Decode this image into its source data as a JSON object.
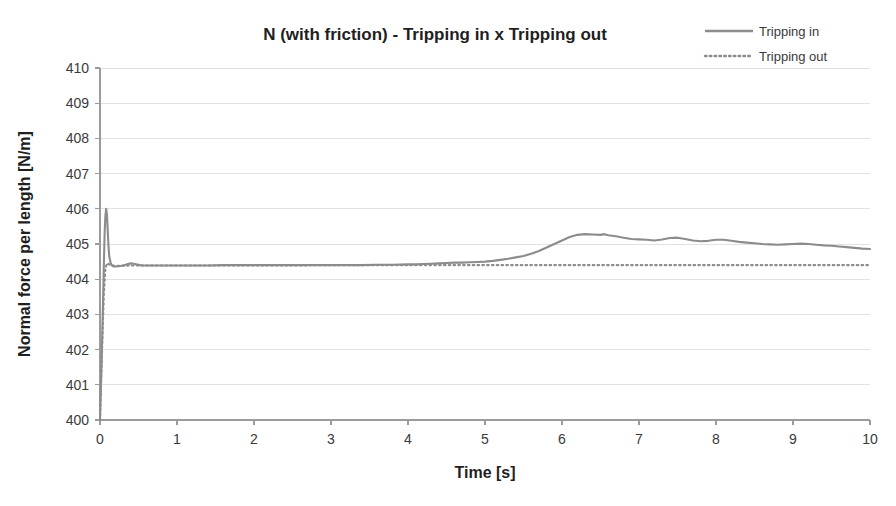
{
  "chart_data": {
    "type": "line",
    "title": "N (with friction) - Tripping in x Tripping out",
    "xlabel": "Time [s]",
    "ylabel": "Normal force per length [N/m]",
    "xlim": [
      0,
      10
    ],
    "ylim": [
      400,
      410
    ],
    "xticks": [
      0,
      1,
      2,
      3,
      4,
      5,
      6,
      7,
      8,
      9,
      10
    ],
    "yticks": [
      400,
      401,
      402,
      403,
      404,
      405,
      406,
      407,
      408,
      409,
      410
    ],
    "xtick_labels": [
      "0",
      "1",
      "2",
      "3",
      "4",
      "5",
      "6",
      "7",
      "8",
      "9",
      "10"
    ],
    "ytick_labels": [
      "400",
      "401",
      "402",
      "403",
      "404",
      "405",
      "406",
      "407",
      "408",
      "409",
      "410"
    ],
    "grid": "horizontal",
    "legend_position": "top-right",
    "colors": {
      "series": "#8c8c8c",
      "grid": "#e2e2e2",
      "axis": "#9b9b9b",
      "text": "#2b2b2b",
      "background": "#ffffff"
    },
    "series": [
      {
        "name": "Tripping in",
        "style": "solid",
        "x": [
          0.0,
          0.02,
          0.04,
          0.05,
          0.06,
          0.07,
          0.08,
          0.09,
          0.1,
          0.11,
          0.12,
          0.14,
          0.16,
          0.18,
          0.2,
          0.24,
          0.28,
          0.32,
          0.36,
          0.4,
          0.44,
          0.48,
          0.52,
          0.56,
          0.6,
          0.7,
          0.8,
          0.9,
          1.0,
          1.2,
          1.4,
          1.6,
          1.8,
          2.0,
          2.2,
          2.4,
          2.6,
          2.8,
          3.0,
          3.2,
          3.4,
          3.6,
          3.8,
          4.0,
          4.1,
          4.2,
          4.3,
          4.4,
          4.5,
          4.6,
          4.7,
          4.8,
          4.9,
          5.0,
          5.1,
          5.2,
          5.3,
          5.4,
          5.5,
          5.6,
          5.7,
          5.8,
          5.9,
          6.0,
          6.1,
          6.2,
          6.3,
          6.4,
          6.5,
          6.55,
          6.6,
          6.7,
          6.8,
          6.9,
          7.0,
          7.1,
          7.2,
          7.3,
          7.4,
          7.5,
          7.6,
          7.7,
          7.8,
          7.9,
          8.0,
          8.1,
          8.2,
          8.3,
          8.4,
          8.5,
          8.6,
          8.7,
          8.8,
          8.9,
          9.0,
          9.1,
          9.2,
          9.3,
          9.4,
          9.5,
          9.6,
          9.7,
          9.8,
          9.9,
          10.0
        ],
        "y": [
          400.0,
          401.6,
          403.4,
          404.4,
          405.3,
          405.8,
          406.0,
          405.85,
          405.4,
          404.95,
          404.65,
          404.45,
          404.38,
          404.36,
          404.36,
          404.37,
          404.38,
          404.4,
          404.43,
          404.45,
          404.44,
          404.42,
          404.4,
          404.39,
          404.39,
          404.39,
          404.39,
          404.39,
          404.39,
          404.39,
          404.39,
          404.4,
          404.4,
          404.4,
          404.4,
          404.4,
          404.4,
          404.4,
          404.4,
          404.4,
          404.4,
          404.41,
          404.41,
          404.42,
          404.42,
          404.43,
          404.44,
          404.45,
          404.46,
          404.47,
          404.47,
          404.48,
          404.49,
          404.5,
          404.52,
          404.55,
          404.58,
          404.62,
          404.66,
          404.72,
          404.8,
          404.9,
          405.0,
          405.1,
          405.2,
          405.26,
          405.28,
          405.27,
          405.26,
          405.28,
          405.25,
          405.22,
          405.18,
          405.14,
          405.13,
          405.12,
          405.1,
          405.13,
          405.17,
          405.18,
          405.14,
          405.1,
          405.08,
          405.09,
          405.12,
          405.12,
          405.09,
          405.06,
          405.04,
          405.02,
          405.0,
          404.99,
          404.98,
          404.99,
          405.0,
          405.01,
          405.0,
          404.98,
          404.96,
          404.95,
          404.93,
          404.91,
          404.89,
          404.87,
          404.86
        ]
      },
      {
        "name": "Tripping out",
        "style": "dotted",
        "x": [
          0.0,
          0.03,
          0.05,
          0.07,
          0.09,
          0.12,
          0.16,
          0.2,
          0.3,
          0.4,
          0.6,
          0.8,
          1.0,
          1.5,
          2.0,
          2.5,
          3.0,
          3.5,
          4.0,
          4.5,
          5.0,
          5.5,
          6.0,
          6.5,
          7.0,
          7.5,
          8.0,
          8.5,
          9.0,
          9.5,
          10.0
        ],
        "y": [
          400.0,
          402.2,
          403.6,
          404.3,
          404.45,
          404.42,
          404.39,
          404.38,
          404.38,
          404.39,
          404.39,
          404.39,
          404.39,
          404.39,
          404.39,
          404.39,
          404.4,
          404.4,
          404.4,
          404.4,
          404.4,
          404.4,
          404.4,
          404.4,
          404.4,
          404.4,
          404.4,
          404.4,
          404.4,
          404.4,
          404.4
        ]
      }
    ],
    "legend": [
      {
        "label": "Tripping in",
        "style": "solid"
      },
      {
        "label": "Tripping out",
        "style": "dotted"
      }
    ]
  }
}
